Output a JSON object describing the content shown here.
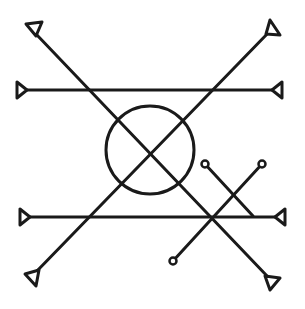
{
  "diagram": {
    "width": 305,
    "height": 309,
    "stroke_color": "#1a1a1a",
    "background": "#ffffff",
    "central_circle": {
      "cx": 150,
      "cy": 150,
      "r": 44
    },
    "lines": [
      {
        "id": "diagonal-tl-br",
        "x1": 36,
        "y1": 34,
        "x2": 268,
        "y2": 277,
        "end_start": "triangle",
        "end_end": "triangle"
      },
      {
        "id": "diagonal-tr-bl",
        "x1": 270,
        "y1": 31,
        "x2": 36,
        "y2": 272,
        "end_start": "triangle",
        "end_end": "triangle"
      },
      {
        "id": "horizontal-upper",
        "x1": 22,
        "y1": 90,
        "x2": 277,
        "y2": 90,
        "end_start": "triangle",
        "end_end": "triangle"
      },
      {
        "id": "horizontal-lower",
        "x1": 24,
        "y1": 217,
        "x2": 279,
        "y2": 217,
        "end_start": "triangle",
        "end_end": "triangle"
      },
      {
        "id": "short-diagonal-a",
        "x1": 205,
        "y1": 164,
        "x2": 253,
        "y2": 216,
        "end_start": "small-circle",
        "end_end": "none"
      },
      {
        "id": "short-diagonal-b",
        "x1": 262,
        "y1": 164,
        "x2": 173,
        "y2": 261,
        "end_start": "small-circle",
        "end_end": "small-circle"
      }
    ],
    "triangles": [
      {
        "id": "tri-top-left",
        "points": "26,24 42,22 36,36"
      },
      {
        "id": "tri-upper-left",
        "points": "17,82 17,98 27,90"
      },
      {
        "id": "tri-top-right",
        "points": "270,20 280,35 266,34"
      },
      {
        "id": "tri-upper-right",
        "points": "282,82 282,98 272,90"
      },
      {
        "id": "tri-lower-left",
        "points": "20,209 20,225 30,217"
      },
      {
        "id": "tri-lower-right",
        "points": "285,209 285,225 275,217"
      },
      {
        "id": "tri-bottom-left",
        "points": "25,274 39,270 36,286"
      },
      {
        "id": "tri-bottom-right",
        "points": "265,276 280,278 270,290"
      }
    ],
    "small_circles": [
      {
        "id": "dot-a-top",
        "cx": 205,
        "cy": 164,
        "r": 3.5
      },
      {
        "id": "dot-b-top",
        "cx": 262,
        "cy": 164,
        "r": 3.5
      },
      {
        "id": "dot-b-bottom",
        "cx": 173,
        "cy": 261,
        "r": 3.5
      }
    ]
  }
}
